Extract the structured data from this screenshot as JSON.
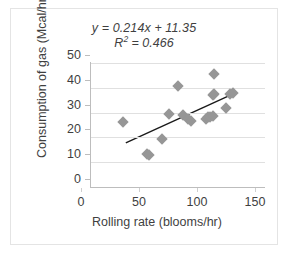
{
  "chart_data": {
    "type": "scatter",
    "title": "",
    "xlabel": "Rolling rate (blooms/hr)",
    "ylabel": "Consumption of gas (Mcal/hr)",
    "xlim": [
      0,
      150
    ],
    "ylim": [
      0,
      50
    ],
    "xticks": [
      0,
      50,
      100,
      150
    ],
    "yticks": [
      0,
      10,
      20,
      30,
      40,
      50
    ],
    "grid": "horizontal",
    "legend": "none",
    "marker_shape": "diamond",
    "marker_color": "#969696",
    "trendline_color": "#1a1a1a",
    "annotations": {
      "equation": "y = 0.214x + 11.35",
      "r_squared_prefix": "R",
      "r_squared_exponent": "2",
      "r_squared_value": " = 0.466"
    },
    "fit": {
      "slope": 0.214,
      "intercept": 11.35,
      "r2": 0.466,
      "x_start": 30,
      "x_end": 123
    },
    "points": [
      {
        "x": 28,
        "y": 26.1
      },
      {
        "x": 48,
        "y": 13.2
      },
      {
        "x": 50,
        "y": 12.9
      },
      {
        "x": 61,
        "y": 19.2
      },
      {
        "x": 67,
        "y": 29.6
      },
      {
        "x": 75,
        "y": 40.9
      },
      {
        "x": 79,
        "y": 29.2
      },
      {
        "x": 84,
        "y": 27.3
      },
      {
        "x": 86,
        "y": 26.7
      },
      {
        "x": 99,
        "y": 27.5
      },
      {
        "x": 101,
        "y": 28.1
      },
      {
        "x": 103,
        "y": 28.3
      },
      {
        "x": 105,
        "y": 28.6
      },
      {
        "x": 105,
        "y": 36.9
      },
      {
        "x": 106,
        "y": 37.3
      },
      {
        "x": 106,
        "y": 45.7
      },
      {
        "x": 116,
        "y": 31.7
      },
      {
        "x": 120,
        "y": 37.6
      },
      {
        "x": 122,
        "y": 37.9
      }
    ]
  },
  "axis_tick_labels": {
    "y": [
      "50",
      "40",
      "30",
      "20",
      "10",
      "0"
    ],
    "x": [
      "0",
      "50",
      "100",
      "150"
    ]
  }
}
